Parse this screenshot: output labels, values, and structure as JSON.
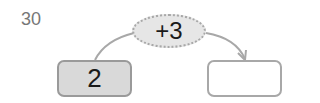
{
  "problem": {
    "number": "30",
    "start_value": "2",
    "operation": "+3",
    "answer_value": ""
  },
  "colors": {
    "start_box_fill": "#d9d9d9",
    "oval_fill": "#e6e6e6",
    "line": "#a8a8a8"
  }
}
